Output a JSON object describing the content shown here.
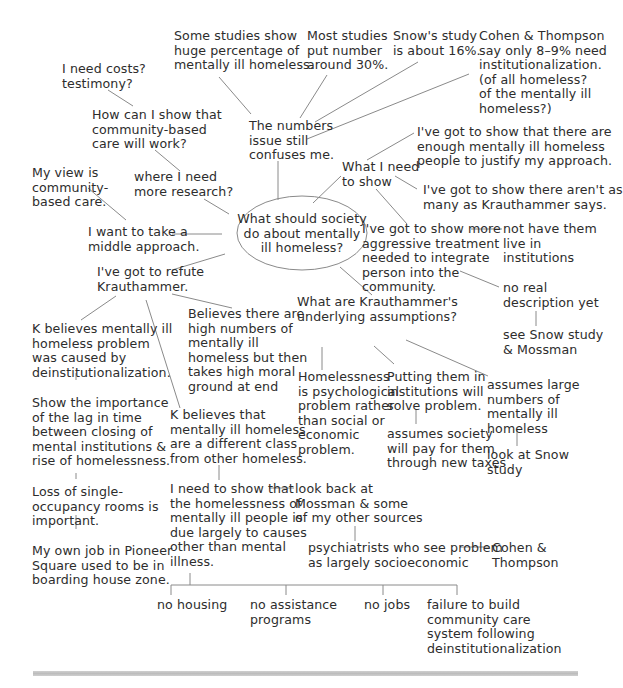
{
  "diagram": {
    "type": "cluster-map",
    "central_question": "What should society\ndo about mentally\nill homeless?",
    "nodes": {
      "some_studies": "Some studies show\nhuge percentage of\nmentally ill homeless.",
      "most_studies": "Most studies\nput number\naround 30%.",
      "snows_study": "Snow's study\nis about 16%.",
      "cohen_thompson": "Cohen & Thompson\nsay only 8–9% need\ninstitutionalization.\n(of all homeless?\nof the mentally ill\nhomeless?)",
      "numbers_issue": "The numbers\nissue still\nconfuses me.",
      "need_costs": "I need costs?\ntestimony?",
      "how_show": "How can I show that\ncommunity-based\ncare will work?",
      "where_research": "where I need\nmore research?",
      "my_view": "My view is\ncommunity-\nbased care.",
      "middle_approach": "I want to take a\nmiddle approach.",
      "what_need_show": "What I need\nto show",
      "enough_ill": "I've got to show that there are\nenough mentally ill homeless\npeople to justify my approach.",
      "not_as_many": "I've got to show there aren't as\nmany as Krauthammer says.",
      "aggressive": "I've got to show more\naggressive treatment\nneeded to integrate\nperson into the\ncommunity.",
      "not_institutions": "not have them\nlive in\ninstitutions",
      "no_real_desc": "no real\ndescription yet",
      "see_snow": "see Snow study\n& Mossman",
      "refute_k": "I've got to refute\nKrauthammer.",
      "k_believes_caused": "K believes mentally ill\nhomeless problem\nwas caused by\ndeinstitutionalization.",
      "believes_high": "Believes there are\nhigh numbers of\nmentally ill\nhomeless but then\ntakes high moral\nground at end",
      "show_lag": "Show the importance\nof the lag in time\nbetween closing of\nmental institutions &\nrise of homelessness.",
      "loss_rooms": "Loss of single-\noccupancy rooms is\nimportant.",
      "own_job": "My own job in Pioneer\nSquare used to be in\nboarding house zone.",
      "k_different_class": "K believes that\nmentally ill homeless\nare a different class\nfrom other homeless.",
      "need_show_causes": "I need to show that\nthe homelessness of\nmentally ill people is\ndue largely to causes\nother than mental\nillness.",
      "look_back": "look back at\nMossman & some\nof my other sources",
      "psychiatrists": "psychiatrists who see problem\nas largely socioeconomic",
      "cohen_thompson_2": "Cohen &\nThompson",
      "k_assumptions": "What are Krauthammer's\nunderlying assumptions?",
      "psych_problem": "Homelessness\nis psychological\nproblem rather\nthan social or\neconomic\nproblem.",
      "institutions_solve": "Putting them in\ninstitutions will\nsolve problem.",
      "society_pay": "assumes society\nwill pay for them\nthrough new taxes",
      "assumes_large": "assumes large\nnumbers of\nmentally ill\nhomeless",
      "look_snow": "look at Snow\nstudy",
      "no_housing": "no housing",
      "no_assistance": "no assistance\nprograms",
      "no_jobs": "no jobs",
      "failure_build": "failure to build\ncommunity care\nsystem following\ndeinstitutionalization"
    }
  }
}
